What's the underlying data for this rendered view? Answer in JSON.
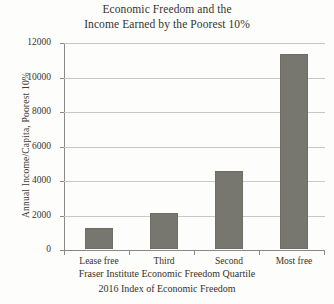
{
  "chart_data": {
    "type": "bar",
    "title": "Economic Freedom and the Income Earned by the Poorest 10%",
    "title_lines": [
      "Economic Freedom and the",
      "Income Earned by the Poorest 10%"
    ],
    "categories": [
      "Lease free",
      "Third",
      "Second",
      "Most free"
    ],
    "values": [
      1200,
      2100,
      4500,
      11300
    ],
    "series": [
      {
        "name": "Annual Income/Capita, Poorest 10%",
        "values": [
          1200,
          2100,
          4500,
          11300
        ]
      }
    ],
    "xlabel": "Fraser Institute Economic Freedom Quartile",
    "ylabel": "Annual Income/Capita, Poorest 10%",
    "ylim": [
      0,
      12000
    ],
    "yticks": [
      0,
      2000,
      4000,
      6000,
      8000,
      10000,
      12000
    ],
    "ytick_labels": [
      "0",
      "2000",
      "4000",
      "6000",
      "8000",
      "10000",
      "12000"
    ],
    "grid": true,
    "legend": false,
    "caption_lines": [
      "Fraser Institute Economic Freedom Quartile",
      "2016 Index of Economic Freedom"
    ],
    "colors": {
      "bar_fill": "#77776f",
      "bar_stroke": "#6d6d66",
      "gridline": "#c9c9c4",
      "axis": "#8a8a84",
      "text": "#33332f",
      "background": "#fdfdfb"
    }
  }
}
